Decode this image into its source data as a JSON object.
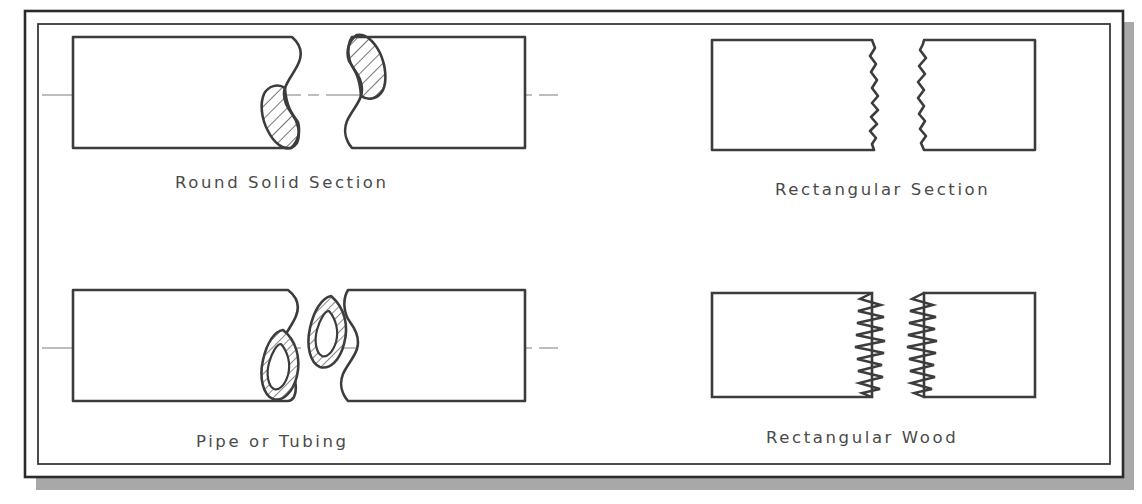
{
  "figure": {
    "frame": {
      "outer_border_color": "#2b2b2b",
      "inner_border_color": "#3a3a3a",
      "shadow_color": "#a8a8a8",
      "background_color": "#ffffff"
    },
    "line_color": "#3c3c3c",
    "centerline_color": "#7c7c7c",
    "hatch_color": "#4a4a4a"
  },
  "panels": [
    {
      "id": "round-solid-section",
      "label": "Round Solid Section",
      "break_style": "s-break",
      "has_centerline": true,
      "hatched": true,
      "hollow": false
    },
    {
      "id": "rectangular-section",
      "label": "Rectangular Section",
      "break_style": "freehand-wavy",
      "has_centerline": false,
      "hatched": false,
      "hollow": false
    },
    {
      "id": "pipe-or-tubing",
      "label": "Pipe or Tubing",
      "break_style": "s-break-annulus",
      "has_centerline": true,
      "hatched": true,
      "hollow": true
    },
    {
      "id": "rectangular-wood",
      "label": "Rectangular Wood",
      "break_style": "zigzag-jagged",
      "has_centerline": false,
      "hatched": false,
      "hollow": false
    }
  ]
}
